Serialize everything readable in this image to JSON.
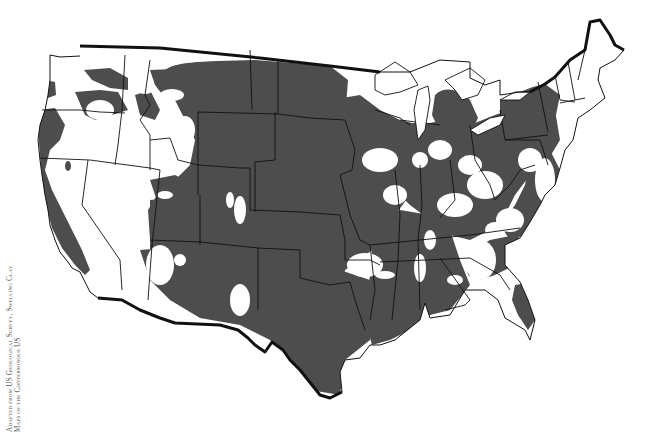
{
  "map": {
    "title": "Swelling clay distribution, conterminous United States",
    "legend_colors": {
      "swelling_clay": "#4d4d4d",
      "low_or_none": "#ffffff",
      "state_border": "#111111",
      "national_border": "#111111"
    }
  },
  "credit": {
    "line1": "Adapted from US Geological Survey, Swelling Clay",
    "line2": "Maps of the Conterminous US"
  }
}
